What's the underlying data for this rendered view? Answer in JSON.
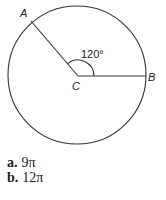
{
  "figure": {
    "point_a_label": "A",
    "point_b_label": "B",
    "center_label": "C",
    "angle_label": "120°",
    "angle_degrees": 120,
    "stroke_color": "#333333"
  },
  "options": [
    {
      "key": "a.",
      "value": "9π"
    },
    {
      "key": "b.",
      "value": "12π"
    }
  ]
}
